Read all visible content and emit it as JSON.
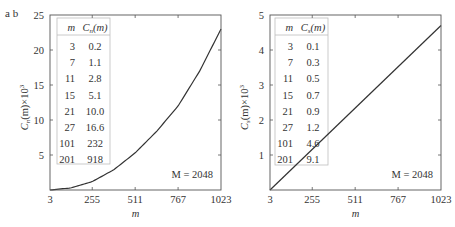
{
  "panel_labels": "a b",
  "chart_data": [
    {
      "type": "line",
      "panel": "a",
      "title": "",
      "xlabel": "m",
      "ylabel": "C_n(m)×10^3",
      "ylabel_parts": {
        "base": "C",
        "sub": "n",
        "rest": "(m)×10",
        "sup": "3"
      },
      "xlim": [
        3,
        1023
      ],
      "ylim": [
        0,
        25
      ],
      "x_ticks": [
        3,
        255,
        511,
        767,
        1023
      ],
      "y_ticks": [
        5,
        10,
        15,
        20,
        25
      ],
      "grid": false,
      "annotation": "M = 2048",
      "series": [
        {
          "name": "C_n(m)",
          "x": [
            3,
            128,
            255,
            384,
            511,
            640,
            767,
            896,
            1023
          ],
          "values": [
            0.0,
            0.3,
            1.2,
            2.9,
            5.3,
            8.4,
            12.0,
            17.0,
            23.0
          ]
        }
      ],
      "table": {
        "headers": [
          "m",
          "C_n(m)"
        ],
        "rows": [
          [
            "3",
            "0.2"
          ],
          [
            "7",
            "1.1"
          ],
          [
            "11",
            "2.8"
          ],
          [
            "15",
            "5.1"
          ],
          [
            "21",
            "10.0"
          ],
          [
            "27",
            "16.6"
          ],
          [
            "101",
            "232"
          ],
          [
            "201",
            "918"
          ]
        ]
      }
    },
    {
      "type": "line",
      "panel": "b",
      "title": "",
      "xlabel": "m",
      "ylabel": "C_s(m)×10^3",
      "ylabel_parts": {
        "base": "C",
        "sub": "s",
        "rest": "(m)×10",
        "sup": "3"
      },
      "xlim": [
        3,
        1023
      ],
      "ylim": [
        0,
        5
      ],
      "x_ticks": [
        3,
        255,
        511,
        767,
        1023
      ],
      "y_ticks": [
        1,
        2,
        3,
        4,
        5
      ],
      "grid": false,
      "annotation": "M = 2048",
      "series": [
        {
          "name": "C_s(m)",
          "x": [
            3,
            1023
          ],
          "values": [
            0.0,
            4.7
          ]
        }
      ],
      "table": {
        "headers": [
          "m",
          "C_s(m)"
        ],
        "rows": [
          [
            "3",
            "0.1"
          ],
          [
            "7",
            "0.3"
          ],
          [
            "11",
            "0.5"
          ],
          [
            "15",
            "0.7"
          ],
          [
            "21",
            "0.9"
          ],
          [
            "27",
            "1.2"
          ],
          [
            "101",
            "4.6"
          ],
          [
            "201",
            "9.1"
          ]
        ]
      }
    }
  ]
}
